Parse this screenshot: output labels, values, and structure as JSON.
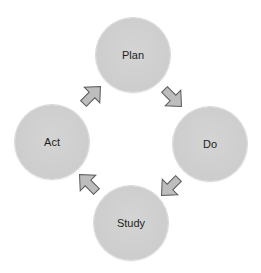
{
  "diagram": {
    "type": "cycle",
    "nodes": [
      {
        "id": "plan",
        "label": "Plan"
      },
      {
        "id": "do",
        "label": "Do"
      },
      {
        "id": "study",
        "label": "Study"
      },
      {
        "id": "act",
        "label": "Act"
      }
    ],
    "edges": [
      {
        "from": "Plan",
        "to": "Do"
      },
      {
        "from": "Do",
        "to": "Study"
      },
      {
        "from": "Study",
        "to": "Act"
      },
      {
        "from": "Act",
        "to": "Plan"
      }
    ],
    "colors": {
      "node_fill": "#cfcfcf",
      "arrow_fill": "#bdbdbd",
      "arrow_stroke": "#5a5a5a",
      "text": "#1e1e1e",
      "background": "#ffffff"
    }
  }
}
